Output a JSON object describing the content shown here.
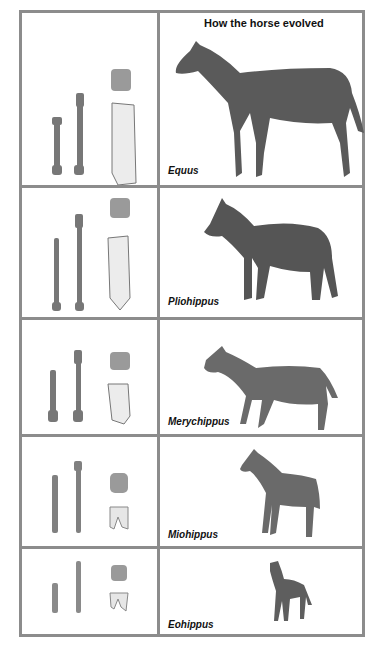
{
  "title": "How the horse evolved",
  "colors": {
    "border": "#8c8c8c",
    "horse": "#5a5a5a",
    "bone": "#7a7a7a",
    "tooth": "#b0b0b0"
  },
  "rows": [
    {
      "name": "Equus",
      "label": "Equus",
      "items": [
        "foreleg-bone",
        "hindleg-bone",
        "tooth-crown",
        "tooth-side"
      ]
    },
    {
      "name": "Pliohippus",
      "label": "Pliohippus",
      "items": [
        "foreleg-bone",
        "hindleg-bone",
        "tooth-crown",
        "tooth-side"
      ]
    },
    {
      "name": "Merychippus",
      "label": "Merychippus",
      "items": [
        "foreleg-bone",
        "hindleg-bone",
        "tooth-crown",
        "tooth-side"
      ]
    },
    {
      "name": "Miohippus",
      "label": "Miohippus",
      "items": [
        "foreleg-bone",
        "hindleg-bone",
        "tooth-crown",
        "tooth-side"
      ]
    },
    {
      "name": "Eohippus",
      "label": "Eohippus",
      "items": [
        "foreleg-bone",
        "hindleg-bone",
        "tooth-crown",
        "tooth-side"
      ]
    }
  ]
}
